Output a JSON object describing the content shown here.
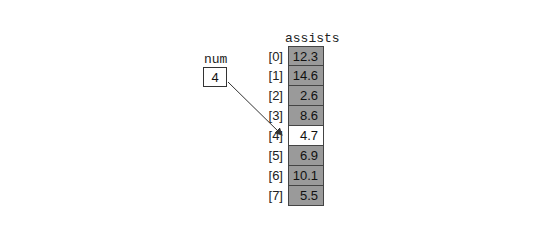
{
  "num": {
    "label": "num",
    "value": "4"
  },
  "array": {
    "label": "assists",
    "highlight_index": 4,
    "cells": [
      {
        "index": "[0]",
        "value": "12.3"
      },
      {
        "index": "[1]",
        "value": "14.6"
      },
      {
        "index": "[2]",
        "value": "2.6"
      },
      {
        "index": "[3]",
        "value": "8.6"
      },
      {
        "index": "[4]",
        "value": "4.7"
      },
      {
        "index": "[5]",
        "value": "6.9"
      },
      {
        "index": "[6]",
        "value": "10.1"
      },
      {
        "index": "[7]",
        "value": "5.5"
      }
    ]
  },
  "colors": {
    "cell_fill": "#9a9a9a",
    "highlight_fill": "#ffffff",
    "border": "#444444"
  }
}
